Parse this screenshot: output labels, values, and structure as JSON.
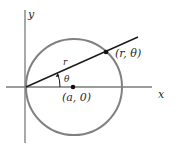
{
  "diagram": {
    "type": "polar-circle",
    "axes": {
      "x_label": "x",
      "y_label": "y"
    },
    "labels": {
      "point_on_circle": "(r, θ)",
      "center": "(a, 0)",
      "radius_segment": "r",
      "angle": "θ"
    },
    "colors": {
      "circle": "#808080",
      "axes": "#7a7a7a",
      "ray": "#1a1a1a",
      "points": "#111111",
      "text": "#2a2a2a",
      "background": "#ffffff"
    }
  }
}
